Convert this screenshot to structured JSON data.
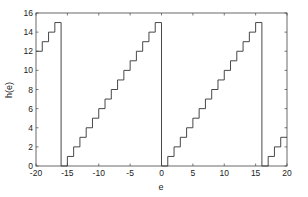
{
  "chart_data": {
    "type": "line",
    "subtype": "step",
    "title": "",
    "xlabel": "e",
    "ylabel": "h(e)",
    "xlim": [
      -20,
      20
    ],
    "ylim": [
      0,
      16
    ],
    "xticks": [
      -20,
      -15,
      -10,
      -5,
      0,
      5,
      10,
      15,
      20
    ],
    "yticks": [
      0,
      2,
      4,
      6,
      8,
      10,
      12,
      14,
      16
    ],
    "grid": false,
    "legend": null,
    "line_color": "#333333",
    "period": 16,
    "series": [
      {
        "name": "h(e)",
        "x": [
          -20,
          -19,
          -18,
          -17,
          -16,
          -15,
          -14,
          -13,
          -12,
          -11,
          -10,
          -9,
          -8,
          -7,
          -6,
          -5,
          -4,
          -3,
          -2,
          -1,
          0,
          1,
          2,
          3,
          4,
          5,
          6,
          7,
          8,
          9,
          10,
          11,
          12,
          13,
          14,
          15,
          16,
          17,
          18,
          19
        ],
        "values": [
          12,
          13,
          14,
          15,
          0,
          1,
          2,
          3,
          4,
          5,
          6,
          7,
          8,
          9,
          10,
          11,
          12,
          13,
          14,
          15,
          0,
          1,
          2,
          3,
          4,
          5,
          6,
          7,
          8,
          9,
          10,
          11,
          12,
          13,
          14,
          15,
          0,
          1,
          2,
          3
        ]
      }
    ]
  }
}
